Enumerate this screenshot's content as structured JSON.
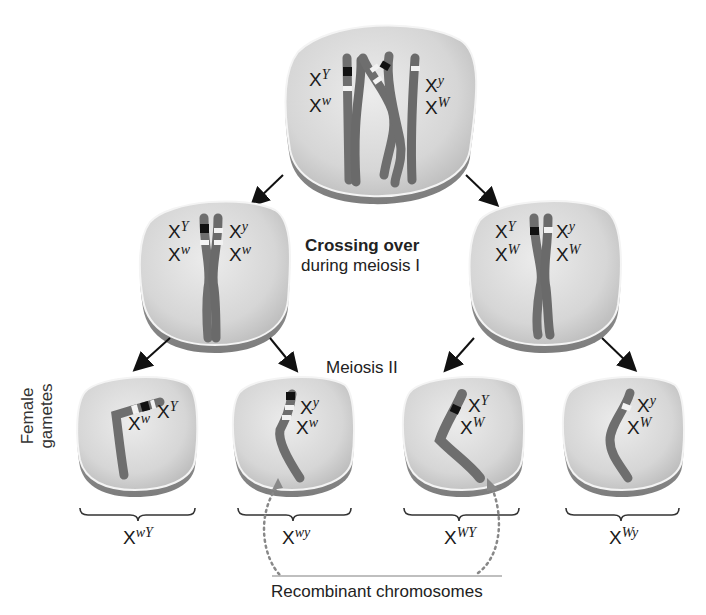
{
  "diagram": {
    "labels": {
      "crossing_over_title": "Crossing over",
      "crossing_over_subtitle": "during meiosis I",
      "meiosis_ii": "Meiosis II",
      "female_gametes_line1": "Female",
      "female_gametes_line2": "gametes",
      "recombinant": "Recombinant chromosomes"
    },
    "parent_cell": {
      "left_alleles": [
        {
          "base": "X",
          "sup": "Y"
        },
        {
          "base": "X",
          "sup": "w"
        }
      ],
      "right_alleles": [
        {
          "base": "X",
          "sup": "y"
        },
        {
          "base": "X",
          "sup": "W"
        }
      ]
    },
    "meiosis_i_cells": [
      {
        "left_alleles": [
          {
            "base": "X",
            "sup": "Y"
          },
          {
            "base": "X",
            "sup": "w"
          }
        ],
        "right_alleles": [
          {
            "base": "X",
            "sup": "y"
          },
          {
            "base": "X",
            "sup": "w"
          }
        ]
      },
      {
        "left_alleles": [
          {
            "base": "X",
            "sup": "Y"
          },
          {
            "base": "X",
            "sup": "W"
          }
        ],
        "right_alleles": [
          {
            "base": "X",
            "sup": "y"
          },
          {
            "base": "X",
            "sup": "W"
          }
        ]
      }
    ],
    "gametes": [
      {
        "alleles": [
          {
            "base": "X",
            "sup": "w"
          },
          {
            "base": "X",
            "sup": "Y"
          }
        ],
        "genotype": {
          "base": "X",
          "sup": "wY"
        },
        "recombinant": false
      },
      {
        "alleles": [
          {
            "base": "X",
            "sup": "y"
          },
          {
            "base": "X",
            "sup": "w"
          }
        ],
        "genotype": {
          "base": "X",
          "sup": "wy"
        },
        "recombinant": true
      },
      {
        "alleles": [
          {
            "base": "X",
            "sup": "Y"
          },
          {
            "base": "X",
            "sup": "W"
          }
        ],
        "genotype": {
          "base": "X",
          "sup": "WY"
        },
        "recombinant": true
      },
      {
        "alleles": [
          {
            "base": "X",
            "sup": "y"
          },
          {
            "base": "X",
            "sup": "W"
          }
        ],
        "genotype": {
          "base": "X",
          "sup": "Wy"
        },
        "recombinant": false
      }
    ],
    "colors": {
      "cell_fill": "#d9d9d9",
      "cell_rim": "#9a9a9a",
      "chromosome": "#6e6e6e",
      "band_dark": "#111111",
      "band_light": "#f2f2f2",
      "arrow": "#111111",
      "dotted": "#888888"
    }
  }
}
